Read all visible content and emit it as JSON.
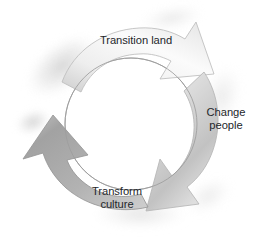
{
  "diagram": {
    "type": "cyclical-three-arrow-process",
    "title": "",
    "background_color": "#ffffff",
    "text_color": "#24272b",
    "inner_circle": {
      "center_x": 131,
      "center_y": 124,
      "radius": 66,
      "stroke_color": "#9b9b9b",
      "fill_color": "#ffffff"
    },
    "arrow_colors": {
      "light": "#f2f2f2",
      "mid": "#d9d9d9",
      "dark": "#a9a9a9",
      "darkest": "#8f8f8f",
      "outline": "#b0b0b0",
      "smudge": "#d6d6d6"
    },
    "steps": [
      {
        "id": "transition-land",
        "label": "Transition land",
        "label_lines": [
          "Transition land"
        ],
        "position": "top",
        "arrow_points_to": "change-people",
        "arrow_head_direction": "down-right",
        "tone": "light"
      },
      {
        "id": "change-people",
        "label": "Change people",
        "label_lines": [
          "Change",
          "people"
        ],
        "position": "right",
        "arrow_points_to": "transform-culture",
        "arrow_head_direction": "down-left",
        "tone": "mid"
      },
      {
        "id": "transform-culture",
        "label": "Transform culture",
        "label_lines": [
          "Transform",
          "culture"
        ],
        "position": "bottom-left",
        "arrow_points_to": "transition-land",
        "arrow_head_direction": "up-left",
        "tone": "dark"
      }
    ]
  }
}
